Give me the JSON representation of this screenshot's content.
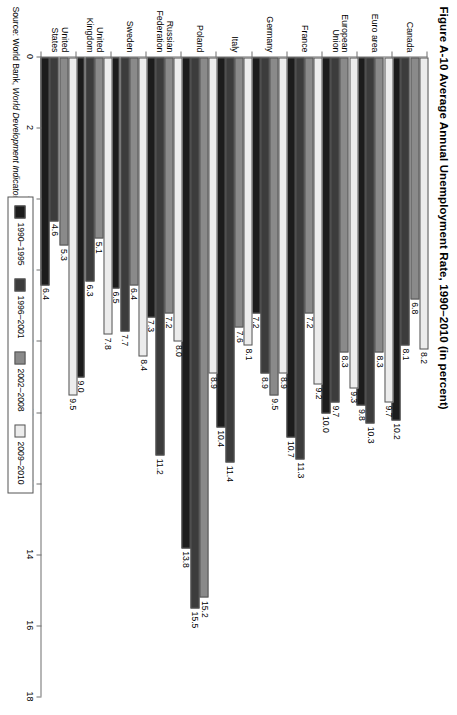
{
  "figure": {
    "title": "Figure A-10  Average Annual Unemployment Rate, 1990–2010 (in percent)",
    "source_prefix": "Source: World Bank, ",
    "source_italic": "World Development Indicators database",
    "source_suffix": ", 2012, http://databank.worldbank.org/ddp/html"
  },
  "legend": {
    "position": "below-right",
    "items": [
      {
        "label": "1990–1995",
        "color": "#1c1c1c"
      },
      {
        "label": "1996–2001",
        "color": "#3c3c3c"
      },
      {
        "label": "2002–2008",
        "color": "#8a8a8a"
      },
      {
        "label": "2009–2010",
        "color": "#ececec"
      }
    ]
  },
  "axis": {
    "ticks": [
      "0",
      "2",
      "4",
      "6",
      "8",
      "10",
      "12",
      "14",
      "16",
      "18"
    ],
    "min": 0,
    "max": 18
  },
  "chart_data": {
    "type": "bar",
    "orientation": "horizontal",
    "title": "Figure A-10  Average Annual Unemployment Rate, 1990–2010 (in percent)",
    "xlabel": "",
    "ylabel": "",
    "xlim": [
      0,
      18
    ],
    "grid": false,
    "legend_position": "below-right",
    "categories": [
      "Canada",
      "Euro area",
      "European Union",
      "France",
      "Germany",
      "Italy",
      "Poland",
      "Russian Federation",
      "Sweden",
      "United Kingdom",
      "United States"
    ],
    "series": [
      {
        "name": "1990–1995",
        "color": "#1c1c1c",
        "values": [
          10.2,
          9.8,
          10.0,
          10.7,
          7.2,
          10.4,
          13.8,
          7.3,
          6.5,
          9.0,
          6.4
        ]
      },
      {
        "name": "1996–2001",
        "color": "#3c3c3c",
        "values": [
          8.1,
          10.3,
          9.7,
          11.3,
          8.9,
          11.4,
          15.5,
          11.2,
          7.7,
          6.3,
          4.6
        ]
      },
      {
        "name": "2002–2008",
        "color": "#8a8a8a",
        "values": [
          6.8,
          8.3,
          8.3,
          7.2,
          9.5,
          7.6,
          15.2,
          7.2,
          6.4,
          5.1,
          5.3
        ]
      },
      {
        "name": "2009–2010",
        "color": "#ececec",
        "values": [
          8.2,
          9.7,
          9.3,
          9.2,
          8.9,
          8.1,
          8.9,
          8.0,
          8.4,
          7.8,
          9.5
        ]
      }
    ]
  }
}
